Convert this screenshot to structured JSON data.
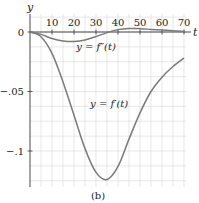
{
  "figure": {
    "caption": "(b)",
    "colors": {
      "axis": "#333333",
      "grid": "#d8d8d8",
      "curve": "#7a7a7a",
      "text": "#222222"
    }
  },
  "chart_data": {
    "type": "line",
    "title": "",
    "xlabel": "t",
    "ylabel": "y",
    "xlim": [
      0,
      70
    ],
    "ylim": [
      -0.13,
      0.005
    ],
    "grid": true,
    "x_ticks": [
      10,
      20,
      30,
      40,
      50,
      60,
      70
    ],
    "x_tick_labels": [
      "10",
      "20",
      "30",
      "40",
      "50",
      "60",
      "70"
    ],
    "y_ticks": [
      0,
      -0.05,
      -0.1
    ],
    "y_tick_labels": [
      "0",
      "−.05",
      "−.1"
    ],
    "series": [
      {
        "name": "y = f'(t)",
        "label": "y = f′(t)",
        "x": [
          0,
          5,
          10,
          15,
          20,
          25,
          30,
          35,
          40,
          45,
          50,
          55,
          60,
          65,
          70
        ],
        "y": [
          0,
          -0.004,
          -0.018,
          -0.042,
          -0.07,
          -0.098,
          -0.118,
          -0.124,
          -0.113,
          -0.09,
          -0.068,
          -0.05,
          -0.038,
          -0.029,
          -0.022
        ]
      },
      {
        "name": "y = f''(t)",
        "label": "y = f″(t)",
        "x": [
          0,
          5,
          10,
          15,
          20,
          25,
          30,
          35,
          40,
          45,
          50,
          55,
          60,
          65,
          70
        ],
        "y": [
          0,
          -0.002,
          -0.0055,
          -0.0075,
          -0.008,
          -0.0068,
          -0.0038,
          -0.0005,
          0.002,
          0.003,
          0.0028,
          0.0022,
          0.0016,
          0.001,
          0.0006
        ]
      }
    ],
    "annotations": [
      {
        "text": "y = f″(t)",
        "x": 30,
        "y": -0.012
      },
      {
        "text": "y = f′(t)",
        "x": 36,
        "y": -0.06
      }
    ]
  }
}
